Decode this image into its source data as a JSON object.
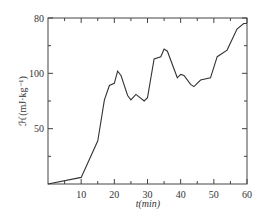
{
  "chart_data": {
    "type": "line",
    "title": "",
    "xlabel": "t(min)",
    "ylabel": "ℋ(mJ·kg⁻¹)",
    "xlim": [
      0,
      60
    ],
    "ylim": [
      0,
      150
    ],
    "x_ticks": [
      10,
      20,
      30,
      40,
      50,
      60
    ],
    "x_minor_ticks": [
      5,
      15,
      25,
      35,
      45,
      55
    ],
    "y_tick_labels": [
      {
        "value": 50,
        "label": "50"
      },
      {
        "value": 100,
        "label": "100"
      },
      {
        "value": 150,
        "label": "80"
      }
    ],
    "y_minor_ticks": [
      25,
      75,
      125
    ],
    "grid": false,
    "legend": null,
    "series": [
      {
        "name": "ℋ",
        "x": [
          0,
          10,
          15,
          17,
          18.5,
          20,
          21,
          22,
          24,
          25,
          26.5,
          29,
          30,
          32,
          34,
          35,
          36,
          39,
          40,
          41,
          43,
          44,
          46,
          49,
          51,
          54,
          57,
          59,
          60
        ],
        "values": [
          0,
          6,
          39,
          76,
          89,
          91,
          102,
          98,
          80,
          76,
          81,
          75,
          78,
          113,
          115,
          122,
          120,
          96,
          99,
          98,
          90,
          88,
          94,
          96,
          115,
          121,
          140,
          145,
          145
        ]
      }
    ],
    "line_color": "#333333"
  }
}
